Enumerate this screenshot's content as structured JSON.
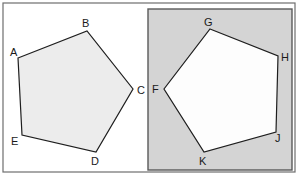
{
  "colors": {
    "background": "#ffffff",
    "frame": "#6e6e6e",
    "panel_fill": "#d4d4d4",
    "panel_border": "#5a5a5a",
    "left_polygon_fill": "#ececec",
    "right_polygon_fill": "#fdfdfd",
    "polygon_stroke": "#1e1e1e"
  },
  "left_pentagon": {
    "vertices": [
      {
        "label": "A",
        "x": 18,
        "y": 58,
        "lx": 10,
        "ly": 56
      },
      {
        "label": "B",
        "x": 87,
        "y": 31,
        "lx": 82,
        "ly": 27
      },
      {
        "label": "C",
        "x": 133,
        "y": 89,
        "lx": 137,
        "ly": 94
      },
      {
        "label": "D",
        "x": 96,
        "y": 152,
        "lx": 91,
        "ly": 165
      },
      {
        "label": "E",
        "x": 22,
        "y": 135,
        "lx": 11,
        "ly": 145
      }
    ]
  },
  "right_pentagon": {
    "vertices": [
      {
        "label": "G",
        "x": 210,
        "y": 29,
        "lx": 204,
        "ly": 26
      },
      {
        "label": "H",
        "x": 278,
        "y": 56,
        "lx": 281,
        "ly": 61
      },
      {
        "label": "J",
        "x": 276,
        "y": 132,
        "lx": 275,
        "ly": 142
      },
      {
        "label": "K",
        "x": 204,
        "y": 152,
        "lx": 199,
        "ly": 165
      },
      {
        "label": "F",
        "x": 164,
        "y": 89,
        "lx": 152,
        "ly": 93
      }
    ]
  }
}
